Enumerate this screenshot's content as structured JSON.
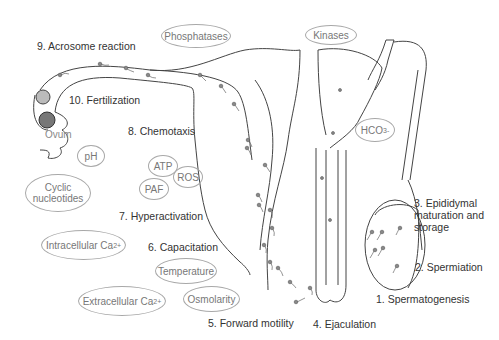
{
  "diagram": {
    "steps": [
      {
        "n": 1,
        "label": "1. Spermatogenesis"
      },
      {
        "n": 2,
        "label": "2. Spermiation"
      },
      {
        "n": 3,
        "label": "3. Epididymal maturation and storage",
        "lines": [
          "3. Epididymal",
          "maturation and",
          "storage"
        ]
      },
      {
        "n": 4,
        "label": "4. Ejaculation"
      },
      {
        "n": 5,
        "label": "5. Forward motility"
      },
      {
        "n": 6,
        "label": "6. Capacitation"
      },
      {
        "n": 7,
        "label": "7. Hyperactivation"
      },
      {
        "n": 8,
        "label": "8. Chemotaxis"
      },
      {
        "n": 9,
        "label": "9. Acrosome reaction"
      },
      {
        "n": 10,
        "label": "10. Fertilization"
      }
    ],
    "factors": {
      "phosphatases": "Phosphatases",
      "kinases": "Kinases",
      "hco3": {
        "base": "HCO",
        "sub": "3",
        "sup": "-"
      },
      "ph": "pH",
      "cyclic_nucleotides": [
        "Cyclic",
        "nucleotides"
      ],
      "atp": "ATP",
      "ros": "ROS",
      "paf": "PAF",
      "intracellular_ca": {
        "base": "Intracellular Ca",
        "sup": "2+"
      },
      "extracellular_ca": {
        "base": "Extracellular Ca",
        "sup": "2+"
      },
      "temperature": "Temperature",
      "osmolarity": "Osmolarity"
    },
    "ovum_label": "Ovum",
    "colors": {
      "line": "#444444",
      "bubble_border": "#a8a8a8",
      "text": "#333333",
      "bubble_text": "#777777"
    }
  }
}
